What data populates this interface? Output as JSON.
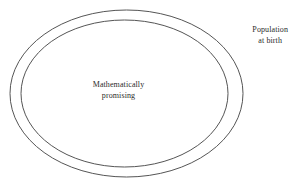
{
  "diagram": {
    "type": "nested-ellipse-venn",
    "background_color": "#ffffff",
    "stroke_color": "#555555",
    "text_color": "#2b2b2b",
    "sets": [
      {
        "name": "outer-set",
        "label_lines": [
          "Population",
          "at birth"
        ],
        "label_position": "outside-right-top",
        "shape": "ellipse",
        "cx": 126.5,
        "cy": 93.5,
        "rx": 116.5,
        "ry": 83.5
      },
      {
        "name": "inner-set",
        "label_lines": [
          "Mathematically",
          "promising"
        ],
        "label_position": "center",
        "shape": "ellipse",
        "cx": 124.5,
        "cy": 93.5,
        "rx": 103.5,
        "ry": 73.5
      }
    ]
  },
  "labels": {
    "outer": {
      "line1": "Population",
      "line2": "at birth"
    },
    "inner": {
      "line1": "Mathematically",
      "line2": "promising"
    }
  }
}
